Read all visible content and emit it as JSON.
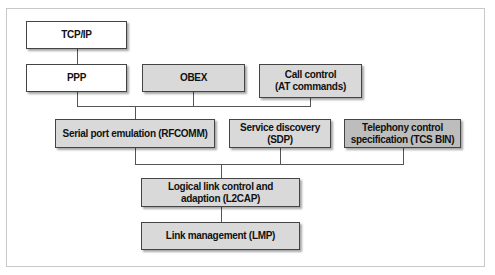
{
  "diagram": {
    "type": "protocol-stack",
    "nodes": [
      {
        "id": "tcpip",
        "label": "TCP/IP",
        "fill": "#ffffff"
      },
      {
        "id": "ppp",
        "label": "PPP",
        "fill": "#ffffff"
      },
      {
        "id": "obex",
        "label": "OBEX",
        "fill": "#d9d9d9"
      },
      {
        "id": "callcontrol",
        "label": "Call control\n(AT commands)",
        "label_lines": [
          "Call control",
          "(AT commands)"
        ],
        "fill": "#d9d9d9"
      },
      {
        "id": "rfcomm",
        "label": "Serial port emulation (RFCOMM)",
        "fill": "#d9d9d9"
      },
      {
        "id": "sdp",
        "label": "Service discovery (SDP)",
        "fill": "#d9d9d9"
      },
      {
        "id": "tcs",
        "label": "Telephony control\nspecification (TCS BIN)",
        "label_lines": [
          "Telephony control",
          "specification (TCS BIN)"
        ],
        "fill": "#bdbdbd"
      },
      {
        "id": "l2cap",
        "label": "Logical link control and\nadaption (L2CAP)",
        "label_lines": [
          "Logical link control and",
          "adaption (L2CAP)"
        ],
        "fill": "#d9d9d9"
      },
      {
        "id": "lmp",
        "label": "Link management (LMP)",
        "fill": "#d9d9d9"
      }
    ],
    "edges": [
      {
        "from": "tcpip",
        "to": "ppp"
      },
      {
        "from": "ppp",
        "to": "rfcomm"
      },
      {
        "from": "obex",
        "to": "rfcomm"
      },
      {
        "from": "callcontrol",
        "to": "rfcomm"
      },
      {
        "from": "rfcomm",
        "to": "l2cap"
      },
      {
        "from": "sdp",
        "to": "l2cap"
      },
      {
        "from": "tcs",
        "to": "l2cap"
      },
      {
        "from": "l2cap",
        "to": "lmp"
      }
    ]
  }
}
